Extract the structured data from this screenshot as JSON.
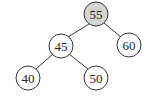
{
  "diagram": {
    "type": "binary-tree",
    "nodes": [
      {
        "id": "n55",
        "label": "55",
        "x": 96,
        "y": 14,
        "highlighted": true
      },
      {
        "id": "n45",
        "label": "45",
        "x": 61,
        "y": 46,
        "highlighted": false
      },
      {
        "id": "n60",
        "label": "60",
        "x": 129,
        "y": 45,
        "highlighted": false
      },
      {
        "id": "n40",
        "label": "40",
        "x": 28,
        "y": 78,
        "highlighted": false
      },
      {
        "id": "n50",
        "label": "50",
        "x": 96,
        "y": 78,
        "highlighted": false
      }
    ],
    "edges": [
      {
        "from": "55",
        "to": "45"
      },
      {
        "from": "55",
        "to": "60"
      },
      {
        "from": "45",
        "to": "40"
      },
      {
        "from": "45",
        "to": "50"
      }
    ],
    "colors": {
      "highlight_fill": "#d3d3d3",
      "node_fill": "#ffffff",
      "stroke": "#333333"
    }
  }
}
